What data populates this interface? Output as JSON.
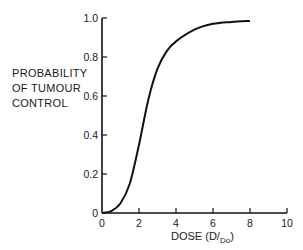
{
  "chart_data": {
    "type": "line",
    "title": "",
    "xlabel": "DOSE (D/Do)",
    "ylabel": "PROBABILITY OF TUMOUR CONTROL",
    "ylabel_lines": [
      "PROBABILITY",
      "OF TUMOUR",
      "CONTROL"
    ],
    "xlim": [
      0,
      10
    ],
    "ylim": [
      0,
      1.0
    ],
    "x_ticks": [
      "0",
      "2",
      "4",
      "6",
      "8",
      "10"
    ],
    "y_ticks": [
      "0",
      "0.2",
      "0.4",
      "0.6",
      "0.8",
      "1.0"
    ],
    "grid": false,
    "legend": null,
    "series": [
      {
        "name": "tumour control probability",
        "x": [
          0,
          0.5,
          1,
          1.5,
          2,
          2.5,
          3,
          3.5,
          4,
          5,
          6,
          7,
          8
        ],
        "y": [
          0,
          0.01,
          0.05,
          0.15,
          0.35,
          0.58,
          0.74,
          0.83,
          0.88,
          0.94,
          0.97,
          0.98,
          0.985
        ]
      }
    ]
  },
  "axes": {
    "xtitle_main": "DOSE (D/",
    "xtitle_sub": "Do",
    "xtitle_close": ")"
  }
}
